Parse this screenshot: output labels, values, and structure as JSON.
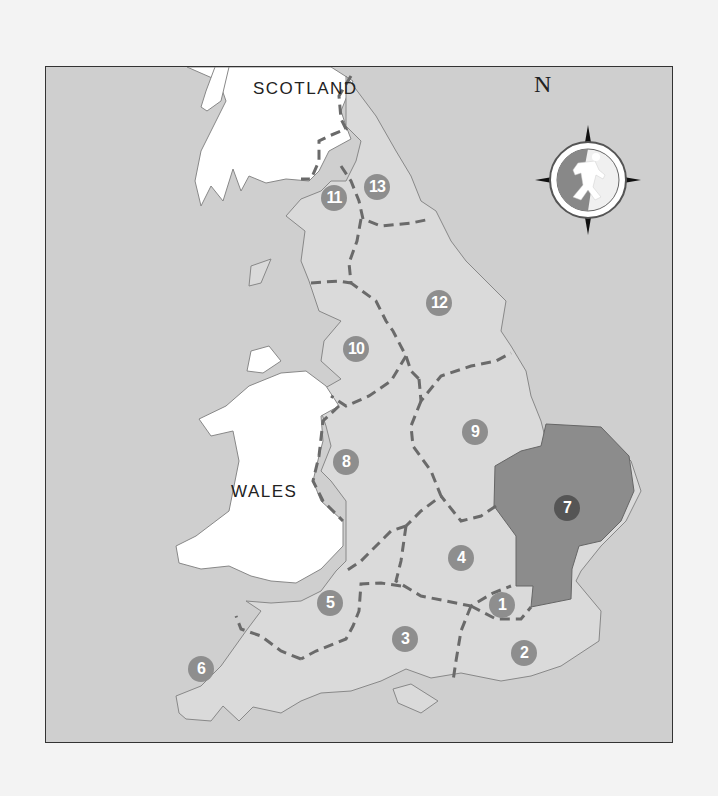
{
  "map": {
    "title": "Regions of England",
    "labels": {
      "scotland": "SCOTLAND",
      "wales": "WALES",
      "north": "N"
    },
    "colors": {
      "sea": "#cfcfcf",
      "england_land": "#dadada",
      "neighbor_land": "#ffffff",
      "highlight_region": "#8c8c8c",
      "boundary": "#6a6a6a",
      "badge": "#8e8e8e",
      "badge_highlight": "#555555"
    },
    "regions": [
      {
        "number": "1",
        "x": 501,
        "y": 604,
        "highlighted": false
      },
      {
        "number": "2",
        "x": 523,
        "y": 652,
        "highlighted": false
      },
      {
        "number": "3",
        "x": 404,
        "y": 638,
        "highlighted": false
      },
      {
        "number": "4",
        "x": 460,
        "y": 557,
        "highlighted": false
      },
      {
        "number": "5",
        "x": 329,
        "y": 602,
        "highlighted": false
      },
      {
        "number": "6",
        "x": 200,
        "y": 668,
        "highlighted": false
      },
      {
        "number": "7",
        "x": 566,
        "y": 507,
        "highlighted": true
      },
      {
        "number": "8",
        "x": 345,
        "y": 461,
        "highlighted": false
      },
      {
        "number": "9",
        "x": 474,
        "y": 431,
        "highlighted": false
      },
      {
        "number": "10",
        "x": 355,
        "y": 348,
        "highlighted": false
      },
      {
        "number": "11",
        "x": 333,
        "y": 197,
        "highlighted": false
      },
      {
        "number": "12",
        "x": 438,
        "y": 302,
        "highlighted": false
      },
      {
        "number": "13",
        "x": 376,
        "y": 186,
        "highlighted": false
      }
    ],
    "compass": {
      "icon": "compass-rose-runner-icon"
    }
  }
}
